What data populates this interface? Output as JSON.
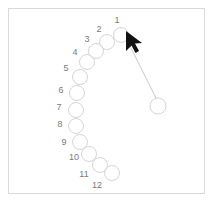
{
  "panel": {
    "background_color": "#ffffff",
    "border_color": "#d9d9d9",
    "frame": {
      "x": 8,
      "y": 8,
      "width": 197,
      "height": 186
    }
  },
  "style": {
    "circle_stroke_color": "#d6d6d6",
    "circle_stroke_width": 1,
    "circle_fill": "none",
    "circle_radius": 7.5,
    "label_color": "#7a7a7a",
    "label_font_size": 9,
    "connector_color": "#c9c9c9",
    "connector_width": 1,
    "cursor_color": "#111111"
  },
  "diagram": {
    "type": "node-sequence",
    "node_count": 13,
    "labeled_node_count": 12,
    "nodes": [
      {
        "id": "node-1",
        "label": "1",
        "cx": 121,
        "cy": 35,
        "r": 7.5,
        "label_x": 117,
        "label_y": 20
      },
      {
        "id": "node-2",
        "label": "2",
        "cx": 107,
        "cy": 42,
        "r": 7.5,
        "label_x": 99,
        "label_y": 29
      },
      {
        "id": "node-3",
        "label": "3",
        "cx": 96,
        "cy": 51,
        "r": 7.5,
        "label_x": 87,
        "label_y": 39
      },
      {
        "id": "node-4",
        "label": "4",
        "cx": 87,
        "cy": 62,
        "r": 7.5,
        "label_x": 75,
        "label_y": 52
      },
      {
        "id": "node-5",
        "label": "5",
        "cx": 80,
        "cy": 77,
        "r": 7.5,
        "label_x": 66,
        "label_y": 68
      },
      {
        "id": "node-6",
        "label": "6",
        "cx": 77,
        "cy": 93,
        "r": 7.5,
        "label_x": 61,
        "label_y": 90
      },
      {
        "id": "node-7",
        "label": "7",
        "cx": 76,
        "cy": 110,
        "r": 7.5,
        "label_x": 59,
        "label_y": 107
      },
      {
        "id": "node-8",
        "label": "8",
        "cx": 76,
        "cy": 126,
        "r": 7.5,
        "label_x": 60,
        "label_y": 124
      },
      {
        "id": "node-9",
        "label": "9",
        "cx": 80,
        "cy": 142,
        "r": 7.5,
        "label_x": 64,
        "label_y": 142
      },
      {
        "id": "node-10",
        "label": "10",
        "cx": 89,
        "cy": 154,
        "r": 7.5,
        "label_x": 74,
        "label_y": 157
      },
      {
        "id": "node-11",
        "label": "11",
        "cx": 100,
        "cy": 165,
        "r": 7.5,
        "label_x": 84,
        "label_y": 174
      },
      {
        "id": "node-12",
        "label": "12",
        "cx": 112,
        "cy": 173,
        "r": 7.5,
        "label_x": 97,
        "label_y": 185
      },
      {
        "id": "node-target",
        "label": "",
        "cx": 158,
        "cy": 106,
        "r": 8.0,
        "label_x": 0,
        "label_y": 0
      }
    ],
    "connector": {
      "from_node": "node-target",
      "to_node": "node-1",
      "x1": 156,
      "y1": 98,
      "x2": 129,
      "y2": 44
    },
    "cursor": {
      "tip_x": 126,
      "tip_y": 31,
      "rotation_deg": 24,
      "points": "126,31 126,51 131.5,45.5 135.5,53 139,51 135,43.5 142,43"
    }
  }
}
